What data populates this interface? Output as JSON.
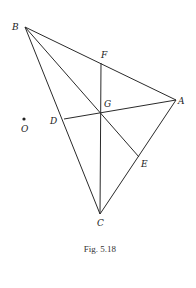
{
  "figure": {
    "caption": "Fig. 5.18",
    "points": {
      "A": {
        "label": "A",
        "x": 176,
        "y": 100
      },
      "B": {
        "label": "B",
        "x": 25,
        "y": 27
      },
      "C": {
        "label": "C",
        "x": 100,
        "y": 214
      },
      "D": {
        "label": "D",
        "x": 64,
        "y": 119
      },
      "E": {
        "label": "E",
        "x": 139,
        "y": 157
      },
      "F": {
        "label": "F",
        "x": 101,
        "y": 63
      },
      "G": {
        "label": "G",
        "x": 100,
        "y": 114
      },
      "O": {
        "label": "O",
        "x": 24,
        "y": 119
      }
    },
    "segments": [
      [
        "B",
        "A"
      ],
      [
        "A",
        "C"
      ],
      [
        "B",
        "C"
      ],
      [
        "B",
        "E"
      ],
      [
        "F",
        "C"
      ],
      [
        "D",
        "A"
      ]
    ]
  }
}
